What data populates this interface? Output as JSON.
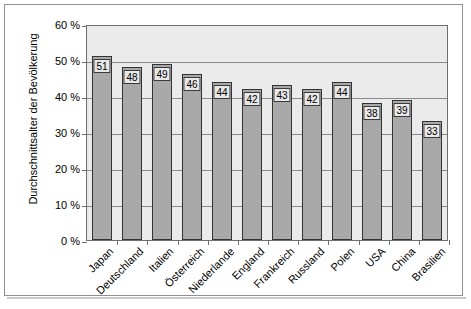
{
  "chart_data": {
    "type": "bar",
    "title": "",
    "xlabel": "",
    "ylabel": "Durchschnittsalter der Bevölkerung",
    "categories": [
      "Japan",
      "Deutschland",
      "Italien",
      "Österreich",
      "Niederlande",
      "England",
      "Frankreich",
      "Russland",
      "Polen",
      "USA",
      "China",
      "Brasilien"
    ],
    "values": [
      51,
      48,
      49,
      46,
      44,
      42,
      43,
      42,
      44,
      38,
      39,
      33
    ],
    "value_labels": [
      "51",
      "48",
      "49",
      "46",
      "44",
      "42",
      "43",
      "42",
      "44",
      "38",
      "39",
      "33"
    ],
    "ylim": [
      0,
      60
    ],
    "ytick_values": [
      0,
      10,
      20,
      30,
      40,
      50,
      60
    ],
    "ytick_labels": [
      "0 %",
      "10 %",
      "20 %",
      "30 %",
      "40 %",
      "50 %",
      "60 %"
    ],
    "grid": "horizontal",
    "legend": "none",
    "series": [
      {
        "name": "Durchschnittsalter der Bevölkerung",
        "values": [
          51,
          48,
          49,
          46,
          44,
          42,
          43,
          42,
          44,
          38,
          39,
          33
        ]
      }
    ],
    "colors": {
      "bar_fill": "#a9a9a9",
      "bar_border": "#333333",
      "plot_background": "#ebebeb",
      "gridline": "#8a8a8a",
      "axis": "#6e6e6e",
      "frame": "#8f8f8f",
      "label_box_fill": "#e8e8e8",
      "label_box_border": "#3a3a3a",
      "text": "#000000"
    }
  }
}
